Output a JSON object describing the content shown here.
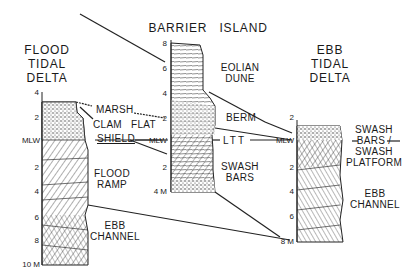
{
  "diagram": {
    "columns": [
      {
        "id": "flood-tidal-delta",
        "title": [
          "FLOOD",
          "TIDAL",
          "DELTA"
        ],
        "depth_ticks": [
          "4",
          "2",
          "MLW",
          "2",
          "4",
          "6",
          "8",
          "10 M"
        ],
        "facies": [
          "MARSH",
          "CLAM FLAT",
          "SHIELD",
          "FLOOD",
          "RAMP",
          "EBB",
          "CHANNEL"
        ]
      },
      {
        "id": "barrier-island",
        "title": [
          "BARRIER ISLAND"
        ],
        "depth_ticks": [
          "8",
          "6",
          "4",
          "2",
          "MLW",
          "2",
          "4 M"
        ],
        "facies": [
          "EOLIAN",
          "DUNE",
          "BERM",
          "LTT",
          "SWASH",
          "BARS"
        ]
      },
      {
        "id": "ebb-tidal-delta",
        "title": [
          "EBB",
          "TIDAL",
          "DELTA"
        ],
        "depth_ticks": [
          "2",
          "MLW",
          "2",
          "4",
          "6",
          "8 M"
        ],
        "facies": [
          "SWASH",
          "BARS /",
          "SWASH",
          "PLATFORM",
          "EBB",
          "CHANNEL"
        ]
      }
    ]
  }
}
